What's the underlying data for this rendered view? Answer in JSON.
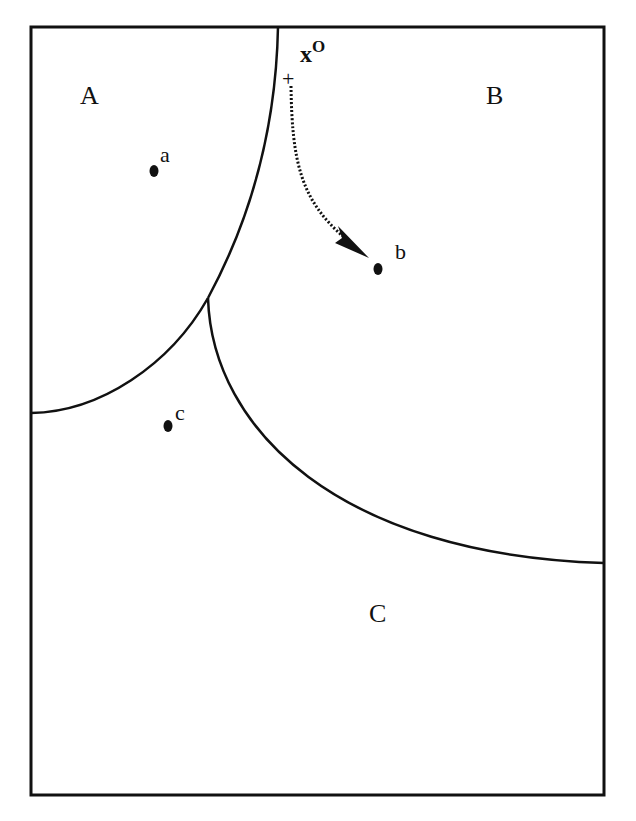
{
  "diagram": {
    "regions": [
      {
        "id": "A",
        "label": "A"
      },
      {
        "id": "B",
        "label": "B"
      },
      {
        "id": "C",
        "label": "C"
      }
    ],
    "points": [
      {
        "id": "a",
        "label": "a"
      },
      {
        "id": "b",
        "label": "b"
      },
      {
        "id": "c",
        "label": "c"
      }
    ],
    "start": {
      "symbol": "+",
      "label": "x",
      "superscript": "O"
    },
    "colors": {
      "ink": "#111111",
      "background": "#ffffff"
    }
  }
}
